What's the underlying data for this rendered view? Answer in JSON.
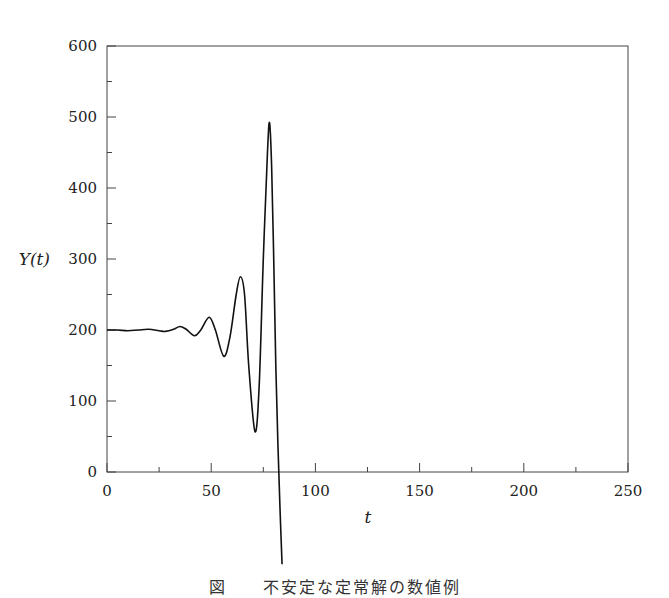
{
  "chart_data": {
    "type": "line",
    "title": "",
    "xlabel": "t",
    "ylabel": "Y(t)",
    "xlim": [
      0,
      250
    ],
    "ylim": [
      0,
      600
    ],
    "grid": false,
    "legend": null,
    "x_ticks": [
      0,
      50,
      100,
      150,
      200,
      250
    ],
    "y_ticks": [
      0,
      100,
      200,
      300,
      400,
      500,
      600
    ],
    "x_minor_ticks": [
      25,
      75,
      125,
      175,
      225
    ],
    "y_minor_ticks": [
      50,
      150,
      250,
      350,
      450,
      550
    ],
    "series": [
      {
        "name": "Y(t)",
        "x": [
          0,
          5,
          10,
          15,
          20,
          25,
          28,
          32,
          35,
          38,
          42,
          45,
          49,
          52,
          56,
          59,
          62,
          64,
          66,
          68,
          71,
          73,
          75,
          77,
          78,
          79,
          80,
          81,
          82,
          83,
          84
        ],
        "y": [
          200,
          200,
          199,
          200,
          201,
          199,
          198,
          201,
          205,
          201,
          192,
          200,
          218,
          200,
          163,
          190,
          250,
          275,
          250,
          150,
          57,
          120,
          300,
          450,
          492,
          430,
          300,
          150,
          40,
          -50,
          -130
        ]
      }
    ],
    "annotations": [],
    "caption": "図　　不安定な定常解の数値例"
  },
  "axes": {
    "xlabel": "t",
    "ylabel": "Y(t)",
    "x_tick_labels": [
      "0",
      "50",
      "100",
      "150",
      "200",
      "250"
    ],
    "y_tick_labels": [
      "0",
      "100",
      "200",
      "300",
      "400",
      "500",
      "600"
    ]
  },
  "caption": "図　　不安定な定常解の数値例"
}
